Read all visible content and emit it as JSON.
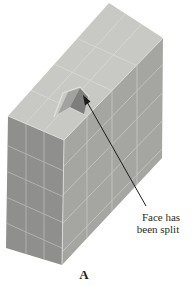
{
  "figure": {
    "panel_label": "A",
    "annotation": {
      "line1": "Face has",
      "line2": "been split"
    },
    "colors": {
      "background": "#ffffff",
      "top_face": "#c8c8c4",
      "front_face": "#8f8f8d",
      "right_face": "#a5a5a2",
      "notch_left_facet": "#a2a2a0",
      "notch_right_facet": "#7e7e7c",
      "grid_line_light": "#d8d8d3",
      "arrow": "#1c1c1c",
      "text": "#2b2b29"
    }
  }
}
